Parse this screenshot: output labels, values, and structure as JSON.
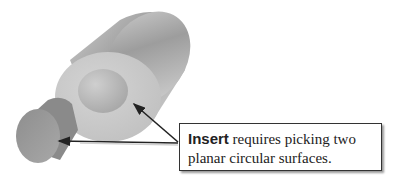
{
  "figure": {
    "shapes": [
      {
        "name": "large-cylinder",
        "role": "part with circular hole"
      },
      {
        "name": "inner-hole-face",
        "role": "planar circular surface 1"
      },
      {
        "name": "small-cylinder",
        "role": "planar circular surface 2"
      }
    ]
  },
  "callout": {
    "keyword": "Insert",
    "line1_rest": " requires picking two",
    "line2": "planar circular surfaces."
  },
  "colors": {
    "background": "#ffffff",
    "cylinder_body": "#b0b0b0",
    "cylinder_face": "#c8c8c8",
    "hole_face": "#bdbdbd",
    "small_cylinder": "#9c9c9c",
    "arrow": "#222222",
    "callout_border": "#333333"
  }
}
